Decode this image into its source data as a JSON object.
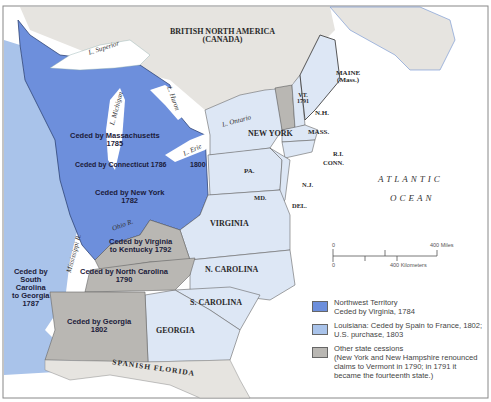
{
  "map": {
    "region_labels": {
      "canada": [
        "BRITISH NORTH AMERICA",
        "(CANADA)"
      ],
      "maine": [
        "MAINE",
        "(Mass.)"
      ],
      "vermont": [
        "VT.",
        "1791"
      ],
      "new_hampshire": "N.H.",
      "massachusetts": "MASS.",
      "rhode_island": "R.I.",
      "connecticut": "CONN.",
      "new_york": "NEW YORK",
      "pennsylvania": "PA.",
      "new_jersey": "N.J.",
      "maryland": "MD.",
      "delaware": "DEL.",
      "virginia": "VIRGINIA",
      "north_carolina": "N. CAROLINA",
      "south_carolina": "S. CAROLINA",
      "georgia": "GEORGIA",
      "spanish_florida": "SPANISH FLORIDA"
    },
    "cession_labels": {
      "massachusetts": [
        "Ceded by Massachusetts",
        "1785"
      ],
      "connecticut": "Ceded by Connecticut 1786",
      "connecticut_1800": "1800",
      "new_york": [
        "Ceded by New York",
        "1782"
      ],
      "virginia_kentucky": [
        "Ceded by Virginia",
        "to Kentucky 1792"
      ],
      "north_carolina": [
        "Ceded by North Carolina",
        "1790"
      ],
      "south_carolina": [
        "Ceded by",
        "South",
        "Carolina",
        "to Georgia",
        "1787"
      ],
      "georgia": [
        "Ceded by Georgia",
        "1802"
      ]
    },
    "water_labels": {
      "superior": "L. Superior",
      "michigan": "L. Michigan",
      "huron": "L. Huron",
      "ontario": "L. Ontario",
      "erie": "L. Erie",
      "ohio": "Ohio R.",
      "mississippi": "Mississippi R.",
      "ocean": [
        "ATLANTIC",
        "OCEAN"
      ]
    },
    "scale": {
      "zero_top": "0",
      "miles": "400 Miles",
      "zero_bottom": "0",
      "km": "400 Kilometers"
    },
    "legend": [
      {
        "color": "#6d8fdc",
        "lines": [
          "Northwest Territory",
          "Ceded by Virginia, 1784"
        ]
      },
      {
        "color": "#a9c3ea",
        "lines": [
          "Louisiana: Ceded by Spain to France, 1802;",
          "U.S. purchase, 1803"
        ]
      },
      {
        "color": "#b9b7b3",
        "lines": [
          "Other state cessions",
          "(New York and New Hampshire renounced",
          "claims to Vermont in 1790; in 1791 it",
          "became the fourteenth state.)"
        ]
      }
    ],
    "colors": {
      "northwest": "#6d8fdc",
      "louisiana": "#a9c3ea",
      "states": "#dde7f5",
      "cession_gray": "#b9b7b3",
      "foreign": "#e6e4e0",
      "water": "#ffffff"
    }
  }
}
